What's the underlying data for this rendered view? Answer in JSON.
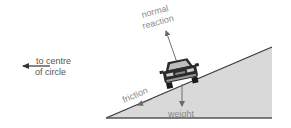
{
  "diagram": {
    "type": "force-diagram",
    "labels": {
      "normal_reaction_line1": "normal",
      "normal_reaction_line2": "reaction",
      "weight": "weight",
      "friction": "friction",
      "centre_line1": "to centre",
      "centre_line2": "of circle"
    },
    "colors": {
      "ramp_fill": "#d9d9d9",
      "ramp_edge": "#3a3a3a",
      "arrow": "#707070",
      "label_text": "#8a8a8a",
      "centre_text": "#555555",
      "car_body": "#2b2b2b"
    },
    "forces": [
      {
        "name": "normal reaction",
        "direction": "perpendicular to slope, upward"
      },
      {
        "name": "weight",
        "direction": "vertically down"
      },
      {
        "name": "friction",
        "direction": "down the slope"
      }
    ]
  }
}
